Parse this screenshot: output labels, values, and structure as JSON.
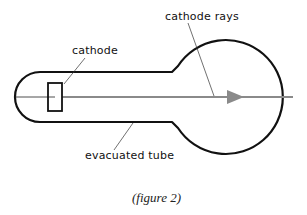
{
  "diagram": {
    "labels": {
      "cathode": "cathode",
      "cathode_rays": "cathode rays",
      "evacuated_tube": "evacuated tube"
    },
    "caption": "(figure 2)",
    "colors": {
      "outline": "#111111",
      "ray": "#8a8a8a",
      "background": "#ffffff"
    }
  }
}
